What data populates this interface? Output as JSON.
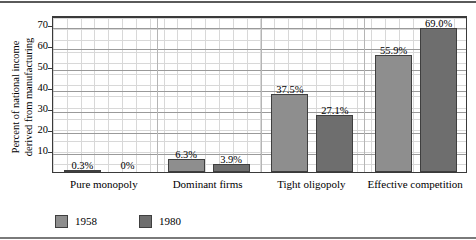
{
  "chart_data": {
    "type": "bar",
    "title": "",
    "xlabel": "",
    "ylabel_line1": "Percent of national income",
    "ylabel_line2": "derived from manufacturing",
    "categories": [
      "Pure monopoly",
      "Dominant firms",
      "Tight oligopoly",
      "Effective competition"
    ],
    "series": [
      {
        "name": "1958",
        "color": "#8e8e8e",
        "values": [
          0.3,
          6.3,
          37.5,
          55.9
        ],
        "labels": [
          "0.3%",
          "6.3%",
          "37.5%",
          "55.9%"
        ]
      },
      {
        "name": "1980",
        "color": "#6e6e6e",
        "values": [
          0.0,
          3.9,
          27.1,
          69.0
        ],
        "labels": [
          "0%",
          "3.9%",
          "27.1%",
          "69.0%"
        ]
      }
    ],
    "ylim": [
      0,
      75
    ],
    "yticks": [
      10,
      20,
      30,
      40,
      50,
      60,
      70
    ],
    "ytick_labels": [
      "10",
      "20",
      "30",
      "40",
      "50",
      "60",
      "70"
    ],
    "grid": true,
    "legend_position": "bottom-left"
  },
  "legend": {
    "items": [
      {
        "label": "1958",
        "color": "#8e8e8e"
      },
      {
        "label": "1980",
        "color": "#6e6e6e"
      }
    ]
  }
}
